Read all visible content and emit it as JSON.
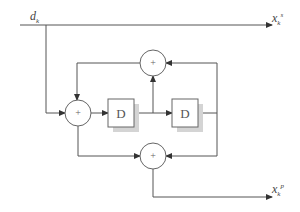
{
  "labels": {
    "input": {
      "base": "d",
      "sub": "k"
    },
    "output_top": {
      "base": "x",
      "sub": "k",
      "sup": "s"
    },
    "output_bottom": {
      "base": "x",
      "sub": "k",
      "sup": "p"
    }
  },
  "adders": {
    "left": "+",
    "top": "+",
    "bottom": "+"
  },
  "delays": {
    "first": "D",
    "second": "D"
  },
  "colors": {
    "line": "#555555",
    "shadow": "#d4d4d4"
  }
}
